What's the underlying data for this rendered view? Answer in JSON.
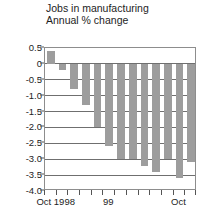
{
  "chart_data": {
    "type": "bar",
    "title": "Jobs in manufacturing",
    "subtitle": "Annual % change",
    "xlabel": "",
    "ylabel": "",
    "ylim": [
      -4.0,
      0.5
    ],
    "grid": true,
    "legend": "none",
    "ytick_labels": [
      "0.5",
      "0",
      "-0.5",
      "-1.0",
      "-1.5",
      "-2.0",
      "-2.5",
      "-3.0",
      "-3.5",
      "-4.0"
    ],
    "ytick_values": [
      0.5,
      0,
      -0.5,
      -1.0,
      -1.5,
      -2.0,
      -2.5,
      -3.0,
      -3.5,
      -4.0
    ],
    "xtick_labels": [
      "Oct 1998",
      "99",
      "Oct"
    ],
    "xtick_label_positions": [
      1,
      5.5,
      11.5
    ],
    "categories": [
      "1",
      "2",
      "3",
      "4",
      "5",
      "6",
      "7",
      "8",
      "9",
      "10",
      "11",
      "12",
      "13"
    ],
    "values": [
      0.4,
      -0.2,
      -0.8,
      -1.3,
      -2.0,
      -2.6,
      -3.0,
      -3.0,
      -3.2,
      -3.4,
      -3.0,
      -3.6,
      -3.1
    ],
    "bar_color": "#9d9d9d",
    "axis_color": "#6f6f6f",
    "background": "#ffffff"
  }
}
